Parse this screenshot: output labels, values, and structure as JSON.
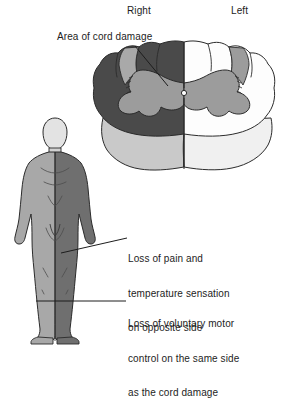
{
  "figure": {
    "orientation_labels": {
      "right": "Right",
      "left": "Left"
    },
    "callouts": {
      "cord_damage": "Area of cord damage",
      "sensory_loss": [
        "Loss of pain and",
        "temperature sensation",
        "on opposite side"
      ],
      "motor_loss": [
        "Loss of voluntary motor",
        "control on the same side",
        "as the cord damage"
      ]
    },
    "colors": {
      "damaged_white_matter": "#4a4a4a",
      "intact_white_matter": "#fdfdfd",
      "gray_matter": "#9a9a9a",
      "cord_depth_damaged": "#c9c9c9",
      "cord_depth_intact": "#efefef",
      "body_light_side": "#a8a8a8",
      "body_dark_side": "#6f6f6f",
      "head_fill": "#e3e3e3",
      "outline": "#2b2b2b",
      "leader_line": "#1d1d1d",
      "background": "#ffffff"
    },
    "icon_names": {
      "cord_cross_section": "spinal-cord-cross-section-icon",
      "human_body": "human-body-figure-icon",
      "leader_damage": "leader-line-icon",
      "leader_sensory": "leader-line-icon",
      "leader_motor": "leader-line-icon"
    }
  }
}
